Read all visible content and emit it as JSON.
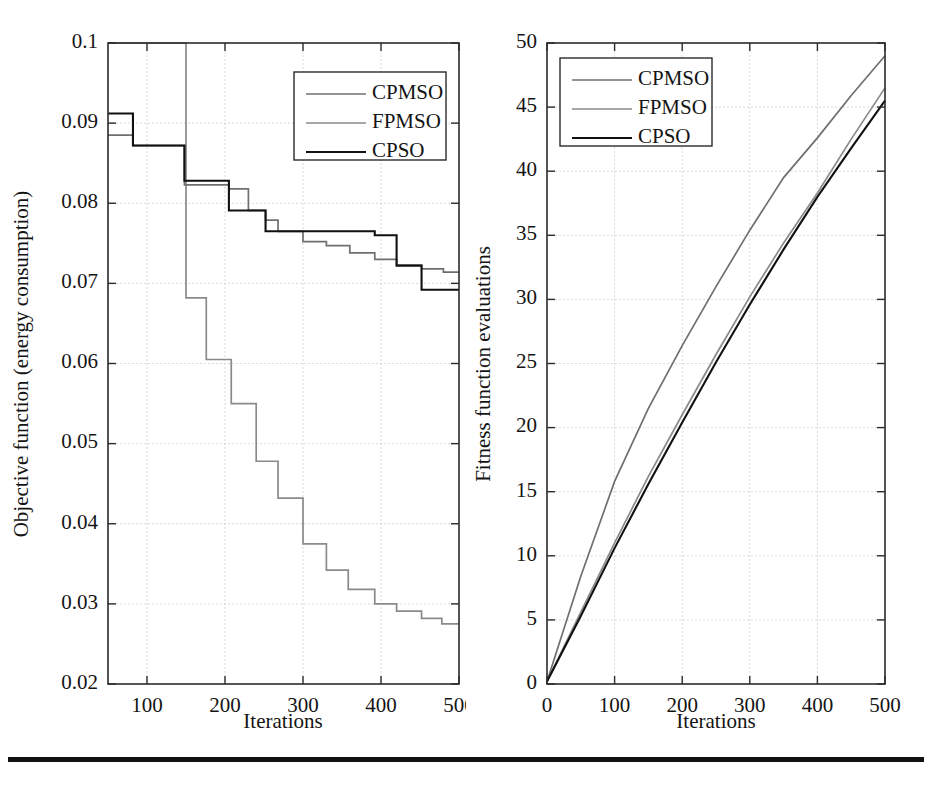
{
  "figure": {
    "background": "#ffffff",
    "rule_color": "#111111",
    "panels": 2
  },
  "colors": {
    "cpmso": "#6f6f6f",
    "fpmso": "#8a8a8a",
    "cpso": "#111111",
    "axis": "#2b2b2b",
    "grid": "#cfcfcf"
  },
  "left_panel": {
    "legend": {
      "position": "upper-right",
      "entries": [
        {
          "label": "CPMSO",
          "color": "#6f6f6f"
        },
        {
          "label": "FPMSO",
          "color": "#8a8a8a"
        },
        {
          "label": "CPSO",
          "color": "#111111"
        }
      ]
    },
    "xlabel": "Iterations",
    "ylabel": "Objective function (energy consumption)",
    "xticks": [
      "100",
      "200",
      "300",
      "400",
      "500"
    ],
    "yticks": [
      "0.02",
      "0.03",
      "0.04",
      "0.05",
      "0.06",
      "0.07",
      "0.08",
      "0.09",
      "0.1"
    ]
  },
  "right_panel": {
    "legend": {
      "position": "upper-left",
      "entries": [
        {
          "label": "CPMSO",
          "color": "#6f6f6f"
        },
        {
          "label": "FPMSO",
          "color": "#8a8a8a"
        },
        {
          "label": "CPSO",
          "color": "#111111"
        }
      ]
    },
    "xlabel": "Iterations",
    "ylabel": "Fitness function evaluations",
    "xticks": [
      "0",
      "100",
      "200",
      "300",
      "400",
      "500"
    ],
    "yticks": [
      "0",
      "5",
      "10",
      "15",
      "20",
      "25",
      "30",
      "35",
      "40",
      "45",
      "50"
    ]
  },
  "chart_data": [
    {
      "type": "line",
      "id": "objective-function-convergence",
      "title": "",
      "xlabel": "Iterations",
      "ylabel": "Objective function (energy consumption)",
      "xlim": [
        50,
        500
      ],
      "ylim": [
        0.02,
        0.1
      ],
      "xticks": [
        100,
        200,
        300,
        400,
        500
      ],
      "yticks": [
        0.02,
        0.03,
        0.04,
        0.05,
        0.06,
        0.07,
        0.08,
        0.09,
        0.1
      ],
      "grid": true,
      "legend_position": "upper right",
      "drawstyle": "steps-post",
      "series": [
        {
          "name": "CPMSO",
          "color": "#6f6f6f",
          "x": [
            50,
            62,
            82,
            110,
            122,
            148,
            175,
            205,
            230,
            252,
            268,
            300,
            330,
            360,
            392,
            420,
            452,
            480,
            500
          ],
          "y": [
            0.0885,
            0.0885,
            0.0872,
            0.0872,
            0.0872,
            0.0823,
            0.0823,
            0.0818,
            0.0791,
            0.0779,
            0.0765,
            0.0752,
            0.0747,
            0.0738,
            0.073,
            0.0723,
            0.0718,
            0.0714,
            0.0714
          ]
        },
        {
          "name": "FPMSO",
          "color": "#8a8a8a",
          "x": [
            50,
            82,
            110,
            122,
            150,
            176,
            208,
            240,
            268,
            300,
            330,
            358,
            392,
            420,
            452,
            478,
            500
          ],
          "y": [
            0.1,
            0.1,
            0.1,
            0.1,
            0.0682,
            0.0605,
            0.055,
            0.0478,
            0.0432,
            0.0375,
            0.0342,
            0.0318,
            0.03,
            0.0291,
            0.0282,
            0.0275,
            0.0275
          ]
        },
        {
          "name": "CPSO",
          "color": "#111111",
          "x": [
            50,
            62,
            82,
            110,
            122,
            148,
            178,
            205,
            230,
            252,
            300,
            360,
            392,
            420,
            452,
            480,
            500
          ],
          "y": [
            0.0912,
            0.0912,
            0.0872,
            0.0872,
            0.0872,
            0.0828,
            0.0828,
            0.0791,
            0.0791,
            0.0765,
            0.0765,
            0.0765,
            0.076,
            0.0722,
            0.0692,
            0.0692,
            0.0692
          ]
        }
      ]
    },
    {
      "type": "line",
      "id": "fitness-function-evaluations",
      "title": "",
      "xlabel": "Iterations",
      "ylabel": "Fitness function evaluations",
      "xlim": [
        0,
        500
      ],
      "ylim": [
        0,
        50
      ],
      "xticks": [
        0,
        100,
        200,
        300,
        400,
        500
      ],
      "yticks": [
        0,
        5,
        10,
        15,
        20,
        25,
        30,
        35,
        40,
        45,
        50
      ],
      "grid": true,
      "legend_position": "upper left",
      "drawstyle": "default",
      "series": [
        {
          "name": "CPMSO",
          "color": "#6f6f6f",
          "x": [
            0,
            50,
            100,
            150,
            200,
            250,
            300,
            350,
            400,
            450,
            500
          ],
          "y": [
            0.2,
            8.4,
            15.8,
            21.5,
            26.4,
            31.0,
            35.4,
            39.5,
            42.6,
            45.9,
            49.0
          ]
        },
        {
          "name": "FPMSO",
          "color": "#8a8a8a",
          "x": [
            0,
            50,
            100,
            150,
            200,
            250,
            300,
            350,
            400,
            450,
            500
          ],
          "y": [
            0.2,
            5.6,
            11.0,
            16.2,
            21.0,
            25.7,
            30.2,
            34.4,
            38.3,
            42.5,
            46.5
          ]
        },
        {
          "name": "CPSO",
          "color": "#111111",
          "x": [
            0,
            50,
            100,
            150,
            200,
            250,
            300,
            350,
            400,
            450,
            500
          ],
          "y": [
            0.2,
            5.3,
            10.6,
            15.6,
            20.4,
            25.1,
            29.6,
            33.9,
            38.0,
            41.8,
            45.5
          ]
        }
      ]
    }
  ]
}
